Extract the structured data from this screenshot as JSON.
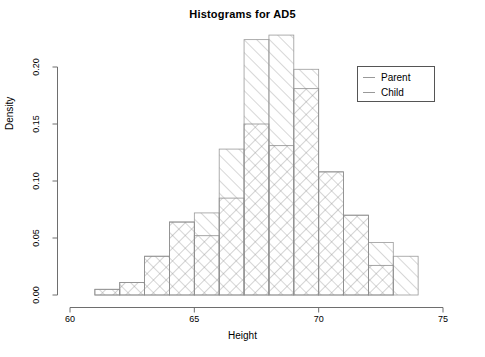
{
  "chart_data": {
    "type": "bar",
    "title": "Histograms for AD5",
    "xlabel": "Height",
    "ylabel": "Density",
    "xlim": [
      60,
      75
    ],
    "ylim": [
      0.0,
      0.23
    ],
    "xticks": [
      60,
      65,
      70,
      75
    ],
    "xtick_labels": [
      "60",
      "65",
      "70",
      "75"
    ],
    "yticks": [
      0.0,
      0.05,
      0.1,
      0.15,
      0.2
    ],
    "ytick_labels": [
      "0.00",
      "0.05",
      "0.10",
      "0.15",
      "0.20"
    ],
    "grid": false,
    "legend_position": "top-right",
    "bin_width": 1,
    "bin_edges": [
      61,
      62,
      63,
      64,
      65,
      66,
      67,
      68,
      69,
      70,
      71,
      72,
      73,
      74
    ],
    "series": [
      {
        "name": "Parent",
        "pattern": "diagonal-hatch-up",
        "color": "#999999",
        "values": [
          0.005,
          0.011,
          0.034,
          0.064,
          0.072,
          0.128,
          0.224,
          0.228,
          0.198,
          0.108,
          0.07,
          0.046,
          0.034
        ]
      },
      {
        "name": "Child",
        "pattern": "diagonal-hatch-down",
        "color": "#888888",
        "values": [
          0.005,
          0.011,
          0.034,
          0.064,
          0.052,
          0.085,
          0.15,
          0.131,
          0.181,
          0.108,
          0.07,
          0.026,
          0.0
        ]
      }
    ]
  },
  "legend": {
    "entries": [
      {
        "label": "Parent"
      },
      {
        "label": "Child"
      }
    ]
  },
  "axes": {
    "x_axis_name": "height-axis",
    "y_axis_name": "density-axis"
  }
}
